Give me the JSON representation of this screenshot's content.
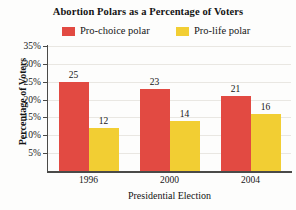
{
  "chart_data": {
    "type": "bar",
    "title": "Abortion Polars as a Percentage of Voters",
    "xlabel": "Presidential Election",
    "ylabel": "Percentage of Voters",
    "categories": [
      "1996",
      "2000",
      "2004"
    ],
    "series": [
      {
        "name": "Pro-choice polar",
        "color": "#E24A42",
        "values": [
          25,
          23,
          21
        ]
      },
      {
        "name": "Pro-life polar",
        "color": "#F2CE33",
        "values": [
          12,
          14,
          16
        ]
      }
    ],
    "ylim": [
      0,
      35
    ],
    "ytick_labels": [
      "35%",
      "30%",
      "25%",
      "20%",
      "15%",
      "10%",
      "5%"
    ],
    "ytick_values": [
      35,
      30,
      25,
      20,
      15,
      10,
      5
    ],
    "grid": true,
    "legend_position": "top",
    "value_labels_shown": true
  },
  "colors": {
    "pro_choice": "#E24A42",
    "pro_life": "#F2CE33",
    "axis": "#4a4a48",
    "gridline": "#e9e7e2",
    "background": "#fdfdfc",
    "text": "#151515"
  }
}
